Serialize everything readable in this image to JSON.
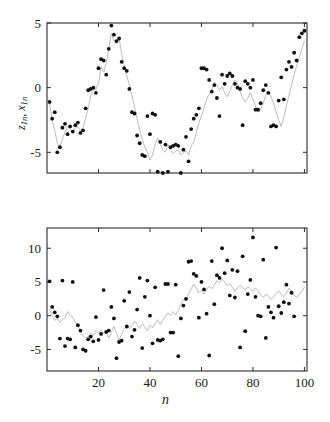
{
  "figure": {
    "background": "#ffffff",
    "line_color": "#b4b4b4",
    "dot_color": "#111111",
    "axis_color": "#2b2b2b"
  },
  "panels": {
    "top": {
      "ylabel_main": "z",
      "ylabel_sub1": "1n",
      "ylabel_sep": ", ",
      "ylabel_main2": "x",
      "ylabel_sub2": "1n",
      "ylabel_text": "z1n, x1n",
      "ytick_labels": [
        "5",
        "0",
        "-5"
      ],
      "ytick_values": [
        5,
        0,
        -5
      ],
      "xtick_labels": [],
      "ylim": [
        -6.6,
        5.0
      ],
      "xlim": [
        0,
        101
      ]
    },
    "bottom": {
      "ylabel_text": "z2n, x2n",
      "ylabel_main": "z",
      "ylabel_sub1": "2n",
      "ylabel_sep": ", ",
      "ylabel_main2": "x",
      "ylabel_sub2": "2n",
      "xlabel": "n",
      "ytick_labels": [
        "10",
        "5",
        "0",
        "-5"
      ],
      "ytick_values": [
        10,
        5,
        0,
        -5
      ],
      "xtick_labels": [
        "20",
        "40",
        "60",
        "80",
        "100"
      ],
      "xtick_values": [
        20,
        40,
        60,
        80,
        100
      ],
      "ylim": [
        -8.2,
        13.0
      ],
      "xlim": [
        0,
        101
      ]
    }
  },
  "chart_data": [
    {
      "type": "line",
      "panel": "top",
      "title": "",
      "xlabel": "",
      "ylabel": "z1n, x1n",
      "xlim": [
        0,
        101
      ],
      "ylim": [
        -6.6,
        5.0
      ],
      "grid": false,
      "legend": "none",
      "yticks": [
        5,
        0,
        -5
      ],
      "xticks": [
        20,
        40,
        60,
        80,
        100
      ],
      "x": [
        1,
        2,
        3,
        4,
        5,
        6,
        7,
        8,
        9,
        10,
        11,
        12,
        13,
        14,
        15,
        16,
        17,
        18,
        19,
        20,
        21,
        22,
        23,
        24,
        25,
        26,
        27,
        28,
        29,
        30,
        31,
        32,
        33,
        34,
        35,
        36,
        37,
        38,
        39,
        40,
        41,
        42,
        43,
        44,
        45,
        46,
        47,
        48,
        49,
        50,
        51,
        52,
        53,
        54,
        55,
        56,
        57,
        58,
        59,
        60,
        61,
        62,
        63,
        64,
        65,
        66,
        67,
        68,
        69,
        70,
        71,
        72,
        73,
        74,
        75,
        76,
        77,
        78,
        79,
        80,
        81,
        82,
        83,
        84,
        85,
        86,
        87,
        88,
        89,
        90,
        91,
        92,
        93,
        94,
        95,
        96,
        97,
        98,
        99,
        100
      ],
      "series": [
        {
          "name": "x1n",
          "role": "true-state-line",
          "style": "line",
          "color": "#b4b4b4",
          "values": [
            -1.2,
            -2.5,
            -3.3,
            -4.3,
            -4.6,
            -4.0,
            -3.4,
            -3.0,
            -3.2,
            -3.4,
            -3.1,
            -3.0,
            -3.3,
            -3.1,
            -2.4,
            -1.6,
            -0.6,
            -0.2,
            -0.1,
            0.3,
            1.6,
            1.2,
            1.9,
            3.0,
            4.2,
            3.6,
            3.4,
            3.8,
            2.6,
            1.7,
            0.9,
            0.2,
            -0.6,
            -1.5,
            -2.4,
            -3.3,
            -4.0,
            -4.6,
            -5.0,
            -5.6,
            -5.2,
            -4.4,
            -3.9,
            -4.3,
            -4.8,
            -5.0,
            -4.4,
            -4.8,
            -5.1,
            -4.9,
            -4.8,
            -5.2,
            -5.0,
            -4.9,
            -5.2,
            -4.5,
            -4.2,
            -3.5,
            -2.7,
            -2.2,
            -1.6,
            -0.9,
            -0.5,
            -0.2,
            0.4,
            0.2,
            -0.2,
            0.1,
            -0.4,
            -0.7,
            -0.3,
            0.2,
            0.6,
            0.3,
            -0.3,
            -0.8,
            -1.1,
            -0.8,
            -0.4,
            -0.9,
            -1.4,
            -1.9,
            -1.7,
            -1.2,
            -0.6,
            -0.3,
            -0.7,
            -1.2,
            -1.9,
            -2.5,
            -3.0,
            -2.3,
            -1.4,
            -0.6,
            0.2,
            1.0,
            1.7,
            2.3,
            3.0,
            3.6,
            4.2
          ]
        },
        {
          "name": "z1n",
          "role": "noisy-observation-dots",
          "style": "scatter",
          "color": "#111111",
          "values": [
            -1.1,
            -2.4,
            -1.9,
            -5.0,
            -4.6,
            -3.1,
            -2.8,
            -3.6,
            -3.0,
            -3.4,
            -2.9,
            -2.7,
            -3.5,
            -3.3,
            -1.6,
            -0.2,
            -0.1,
            0.0,
            -0.4,
            1.5,
            2.2,
            2.1,
            1.0,
            3.0,
            4.8,
            4.1,
            3.6,
            3.8,
            2.0,
            1.5,
            1.3,
            -0.1,
            -1.9,
            -2.0,
            -3.7,
            -4.3,
            -5.2,
            -5.3,
            -2.2,
            -3.6,
            -2.0,
            -2.1,
            -6.5,
            -4.2,
            -6.6,
            -4.4,
            -6.5,
            -4.6,
            -4.5,
            -4.4,
            -4.5,
            -6.6,
            -4.8,
            -3.8,
            -5.7,
            -3.2,
            -2.4,
            -2.1,
            -1.6,
            1.5,
            1.5,
            1.4,
            0.6,
            -0.3,
            0.2,
            -0.8,
            -2.2,
            1.0,
            0.3,
            0.9,
            1.1,
            0.9,
            0.3,
            0.0,
            -0.1,
            -2.9,
            0.5,
            0.3,
            0.0,
            0.6,
            -1.7,
            -1.7,
            -1.2,
            -0.2,
            0.2,
            -0.4,
            -3.0,
            -2.9,
            -3.0,
            -1.0,
            0.8,
            -0.9,
            1.4,
            2.0,
            1.6,
            2.7,
            2.1,
            3.9,
            4.2,
            4.4
          ]
        }
      ]
    },
    {
      "type": "line",
      "panel": "bottom",
      "title": "",
      "xlabel": "n",
      "ylabel": "z2n, x2n",
      "xlim": [
        0,
        101
      ],
      "ylim": [
        -8.2,
        13.0
      ],
      "grid": false,
      "legend": "none",
      "yticks": [
        10,
        5,
        0,
        -5
      ],
      "xticks": [
        20,
        40,
        60,
        80,
        100
      ],
      "x": [
        1,
        2,
        3,
        4,
        5,
        6,
        7,
        8,
        9,
        10,
        11,
        12,
        13,
        14,
        15,
        16,
        17,
        18,
        19,
        20,
        21,
        22,
        23,
        24,
        25,
        26,
        27,
        28,
        29,
        30,
        31,
        32,
        33,
        34,
        35,
        36,
        37,
        38,
        39,
        40,
        41,
        42,
        43,
        44,
        45,
        46,
        47,
        48,
        49,
        50,
        51,
        52,
        53,
        54,
        55,
        56,
        57,
        58,
        59,
        60,
        61,
        62,
        63,
        64,
        65,
        66,
        67,
        68,
        69,
        70,
        71,
        72,
        73,
        74,
        75,
        76,
        77,
        78,
        79,
        80,
        81,
        82,
        83,
        84,
        85,
        86,
        87,
        88,
        89,
        90,
        91,
        92,
        93,
        94,
        95,
        96,
        97,
        98,
        99,
        100
      ],
      "series": [
        {
          "name": "x2n",
          "role": "true-state-line",
          "style": "line",
          "color": "#b4b4b4",
          "values": [
            0.9,
            0.0,
            -0.7,
            -0.4,
            -1.0,
            -0.6,
            -0.3,
            0.6,
            0.2,
            -0.3,
            -0.9,
            -1.6,
            -2.2,
            -2.9,
            -3.3,
            -3.1,
            -2.6,
            -2.9,
            -2.2,
            -2.6,
            -2.1,
            -2.6,
            -2.3,
            -3.3,
            -2.5,
            -1.6,
            -2.6,
            -3.6,
            -2.8,
            -2.0,
            -1.5,
            -1.9,
            -1.4,
            -0.8,
            -1.3,
            -1.9,
            -1.2,
            -1.7,
            -2.2,
            -1.4,
            -1.8,
            -1.2,
            -0.6,
            -1.3,
            -0.7,
            -0.1,
            0.4,
            0.0,
            0.6,
            0.1,
            0.8,
            1.7,
            2.5,
            2.2,
            3.2,
            4.0,
            4.7,
            4.1,
            3.4,
            3.8,
            3.2,
            3.9,
            4.4,
            4.0,
            4.5,
            5.2,
            4.9,
            5.4,
            5.0,
            4.4,
            4.8,
            4.2,
            3.6,
            4.1,
            4.5,
            4.2,
            3.8,
            4.3,
            4.0,
            3.6,
            4.1,
            3.7,
            3.1,
            2.7,
            3.2,
            2.9,
            2.4,
            2.8,
            3.3,
            3.7,
            3.2,
            2.8,
            3.3,
            4.1,
            3.7,
            3.1,
            2.7,
            3.1,
            3.6,
            4.2,
            3.4
          ]
        },
        {
          "name": "z2n",
          "role": "noisy-observation-dots",
          "style": "scatter",
          "color": "#111111",
          "values": [
            5.1,
            1.3,
            0.5,
            -0.1,
            -3.4,
            5.2,
            -4.5,
            -3.4,
            -3.5,
            5.0,
            -4.7,
            -1.4,
            -2.2,
            -5.0,
            -5.2,
            -3.5,
            -3.1,
            -3.8,
            -0.2,
            -3.6,
            -2.7,
            3.8,
            -2.4,
            -2.2,
            1.3,
            -0.4,
            -6.3,
            -3.9,
            -3.7,
            2.2,
            -1.6,
            3.5,
            -3.1,
            -2.1,
            0.9,
            5.6,
            -4.8,
            2.8,
            5.2,
            0.0,
            -4.1,
            4.2,
            -3.6,
            -3.7,
            -3.5,
            4.7,
            4.7,
            -2.5,
            -2.5,
            4.6,
            -6.0,
            -0.4,
            1.5,
            2.5,
            8.0,
            8.1,
            6.2,
            5.9,
            -0.3,
            5.0,
            3.9,
            0.3,
            -5.9,
            8.1,
            1.7,
            6.0,
            5.6,
            10.0,
            6.3,
            8.2,
            3.0,
            6.8,
            2.7,
            6.6,
            -4.7,
            8.8,
            -2.3,
            3.2,
            5.3,
            11.6,
            2.8,
            0.0,
            -0.1,
            8.3,
            -3.3,
            1.3,
            0.5,
            -0.3,
            10.1,
            1.4,
            0.4,
            2.0,
            4.6,
            1.8,
            3.4,
            -0.1
          ]
        }
      ]
    }
  ]
}
